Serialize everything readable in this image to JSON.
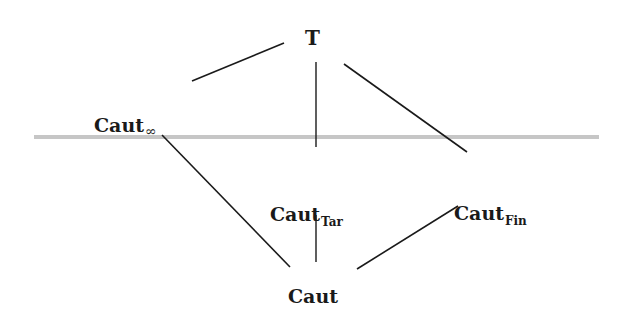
{
  "diagram": {
    "type": "lattice",
    "separator": {
      "color": "#c6c6c6",
      "x1": 34,
      "y1": 137,
      "x2": 599,
      "y2": 137,
      "width": 4
    },
    "nodes": [
      {
        "id": "top",
        "base": "T",
        "sub": "",
        "x": 302,
        "y": 26
      },
      {
        "id": "caut_inf",
        "base": "Caut",
        "sub": "∞",
        "x": 94,
        "y": 113
      },
      {
        "id": "caut_tar",
        "base": "Caut",
        "sub": "Tar",
        "x": 270,
        "y": 203
      },
      {
        "id": "caut_fin",
        "base": "Caut",
        "sub": "Fin",
        "x": 455,
        "y": 203
      },
      {
        "id": "caut",
        "base": "Caut",
        "sub": "",
        "x": 287,
        "y": 352
      }
    ],
    "edges": [
      {
        "from": "top",
        "to": "caut_inf",
        "x1": 284,
        "y1": 43,
        "x2": 192,
        "y2": 81
      },
      {
        "from": "top",
        "to": "caut_tar",
        "x1": 316,
        "y1": 62,
        "x2": 316,
        "y2": 147
      },
      {
        "from": "top",
        "to": "caut_fin",
        "x1": 344,
        "y1": 64,
        "x2": 467,
        "y2": 152
      },
      {
        "from": "caut_inf",
        "to": "caut",
        "x1": 162,
        "y1": 135,
        "x2": 290,
        "y2": 267
      },
      {
        "from": "caut_tar",
        "to": "caut",
        "x1": 316,
        "y1": 215,
        "x2": 316,
        "y2": 262
      },
      {
        "from": "caut_fin",
        "to": "caut",
        "x1": 458,
        "y1": 206,
        "x2": 357,
        "y2": 269
      }
    ],
    "edge_color": "#1a1a1a"
  },
  "labels": {
    "top": {
      "base": "T",
      "sub": ""
    },
    "caut_inf": {
      "base": "Caut",
      "sub": "∞"
    },
    "caut_tar": {
      "base": "Caut",
      "sub": "Tar"
    },
    "caut_fin": {
      "base": "Caut",
      "sub": "Fin"
    },
    "caut": {
      "base": "Caut",
      "sub": ""
    }
  }
}
